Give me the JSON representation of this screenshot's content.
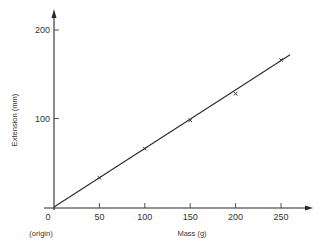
{
  "chart_data": {
    "type": "line",
    "title": "",
    "xlabel": "Mass (g)",
    "ylabel": "Extension (mm)",
    "origin_label": "(origin)",
    "xlim": [
      0,
      280
    ],
    "ylim": [
      0,
      220
    ],
    "x_ticks": [
      0,
      50,
      100,
      150,
      200,
      250
    ],
    "x_tick_labels": [
      "0",
      "50",
      "100",
      "150",
      "200",
      "250"
    ],
    "y_ticks": [
      100,
      200
    ],
    "y_tick_labels": [
      "100",
      "200"
    ],
    "grid": false,
    "legend": null,
    "series": [
      {
        "name": "Measured points",
        "style": "cross-markers",
        "x": [
          50,
          100,
          150,
          200,
          250
        ],
        "y": [
          33,
          66,
          98,
          128,
          166
        ]
      },
      {
        "name": "Best-fit line",
        "style": "line",
        "x": [
          0,
          260
        ],
        "y": [
          0,
          172
        ]
      }
    ]
  }
}
